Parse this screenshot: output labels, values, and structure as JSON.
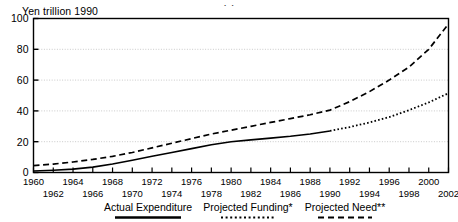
{
  "title_remnant": "· ·",
  "axis_unit_label": "Yen trillion 1990",
  "chart_data": {
    "type": "line",
    "title": "",
    "xlabel": "",
    "ylabel": "Yen trillion 1990",
    "ylim": [
      0,
      100
    ],
    "xlim": [
      1960,
      2002
    ],
    "yticks": [
      0,
      20,
      40,
      60,
      80,
      100
    ],
    "ytick_labels": [
      "0",
      "20",
      "40",
      "60",
      "80",
      "100"
    ],
    "grid": "horizontal-dotted",
    "legend_position": "bottom",
    "xticks_row_top": [
      1960,
      1964,
      1968,
      1972,
      1976,
      1980,
      1984,
      1988,
      1992,
      1996,
      2000
    ],
    "xticks_row_bottom": [
      1962,
      1966,
      1970,
      1974,
      1978,
      1982,
      1986,
      1990,
      1994,
      1998,
      2002
    ],
    "xticks_all": [
      1960,
      1962,
      1964,
      1966,
      1968,
      1970,
      1972,
      1974,
      1976,
      1978,
      1980,
      1982,
      1984,
      1986,
      1988,
      1990,
      1992,
      1994,
      1996,
      1998,
      2000,
      2002
    ],
    "series": [
      {
        "name": "Actual Expenditure",
        "style": "solid",
        "x": [
          1960,
          1962,
          1964,
          1966,
          1968,
          1970,
          1972,
          1974,
          1976,
          1978,
          1980,
          1982,
          1984,
          1986,
          1988,
          1990
        ],
        "values": [
          1.0,
          1.5,
          2.2,
          3.5,
          5.5,
          8.0,
          10.5,
          13.0,
          15.5,
          18.0,
          20.0,
          21.2,
          22.3,
          23.5,
          25.0,
          27.0
        ]
      },
      {
        "name": "Projected Funding*",
        "style": "dotted",
        "x": [
          1990,
          1992,
          1994,
          1996,
          1998,
          2000,
          2002
        ],
        "values": [
          27.0,
          29.5,
          32.5,
          36.0,
          40.5,
          45.5,
          51.5
        ]
      },
      {
        "name": "Projected Need**",
        "style": "dashed",
        "x": [
          1960,
          1962,
          1964,
          1966,
          1968,
          1970,
          1972,
          1974,
          1976,
          1978,
          1980,
          1982,
          1984,
          1986,
          1988,
          1990,
          1992,
          1994,
          1996,
          1998,
          2000,
          2002
        ],
        "values": [
          4.5,
          5.5,
          6.8,
          8.5,
          10.5,
          13.0,
          16.0,
          19.0,
          22.0,
          25.0,
          27.5,
          30.0,
          32.5,
          35.0,
          37.5,
          40.5,
          46.0,
          52.5,
          60.0,
          68.5,
          80.0,
          96.5
        ]
      }
    ]
  },
  "legend": {
    "items": [
      {
        "label": "Actual Expenditure",
        "style": "solid"
      },
      {
        "label": "Projected Funding*",
        "style": "dotted"
      },
      {
        "label": "Projected Need**",
        "style": "dashed"
      }
    ]
  },
  "colors": {
    "line": "#000000",
    "grid": "#c9c9c9",
    "axis": "#000000",
    "background": "#ffffff"
  }
}
